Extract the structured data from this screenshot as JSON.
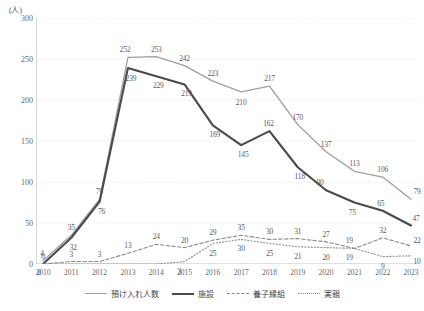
{
  "chart_data": {
    "type": "line",
    "title": "",
    "xlabel": "",
    "ylabel": "",
    "unit_label": "(人)",
    "categories": [
      "2010",
      "2011",
      "2012",
      "2013",
      "2014",
      "2015",
      "2016",
      "2017",
      "2018",
      "2019",
      "2020",
      "2021",
      "2022",
      "2023"
    ],
    "ylim": [
      0,
      300
    ],
    "yticks": [
      0,
      50,
      100,
      150,
      200,
      250,
      300
    ],
    "grid": true,
    "legend_position": "bottom",
    "series": [
      {
        "name": "預け入れ人数",
        "color": "#9e9e9e",
        "style": "solid",
        "width": 1.3,
        "values": [
          4,
          35,
          79,
          252,
          253,
          242,
          223,
          210,
          217,
          170,
          137,
          113,
          106,
          79
        ],
        "labels": [
          "4",
          "35",
          "79",
          "252",
          "253",
          "242",
          "223",
          "210",
          "217",
          "170",
          "137",
          "113",
          "106",
          "79"
        ]
      },
      {
        "name": "施設",
        "color": "#4a4a4a",
        "style": "solid",
        "width": 2.1,
        "values": [
          0,
          32,
          76,
          239,
          229,
          219,
          169,
          145,
          162,
          118,
          90,
          75,
          65,
          47
        ],
        "labels": [
          "0",
          "32",
          "76",
          "239",
          "229",
          "219",
          "169",
          "145",
          "162",
          "118",
          "90",
          "75",
          "65",
          "47"
        ]
      },
      {
        "name": "養子縁組",
        "color": "#8a8a8a",
        "style": "dashed",
        "width": 1.1,
        "values": [
          0,
          3,
          3,
          13,
          24,
          20,
          29,
          35,
          30,
          31,
          27,
          19,
          32,
          22
        ],
        "labels": [
          "0",
          "3",
          "3",
          "13",
          "24",
          "20",
          "29",
          "35",
          "30",
          "31",
          "27",
          "19",
          "32",
          "22"
        ]
      },
      {
        "name": "実親",
        "color": "#8a8a8a",
        "style": "dotted",
        "width": 1.1,
        "values": [
          0,
          0,
          0,
          0,
          0,
          3,
          25,
          30,
          25,
          21,
          20,
          19,
          9,
          10
        ],
        "labels": [
          "",
          "",
          "",
          "",
          "",
          "3",
          "25",
          "30",
          "25",
          "21",
          "20",
          "19",
          "9",
          "10"
        ]
      }
    ]
  },
  "legend": {
    "items": [
      {
        "label": "預け入れ人数"
      },
      {
        "label": "施設"
      },
      {
        "label": "養子縁組"
      },
      {
        "label": "実親"
      }
    ]
  }
}
